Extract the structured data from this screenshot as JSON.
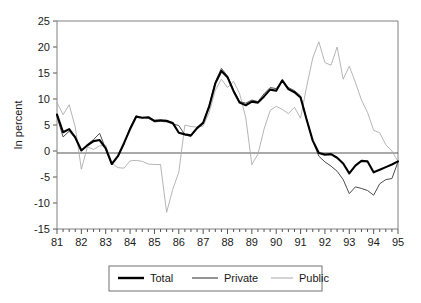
{
  "chart_data": {
    "type": "line",
    "title": "",
    "xlabel": "",
    "ylabel": "In percent",
    "ylim": [
      -15,
      25
    ],
    "xlim": [
      1981.0,
      1995.0
    ],
    "ytick_labels": [
      "25",
      "20",
      "15",
      "10",
      "5",
      "0",
      "-5",
      "-10",
      "-15"
    ],
    "ytick_values": [
      25,
      20,
      15,
      10,
      5,
      0,
      -5,
      -10,
      -15
    ],
    "xtick_labels": [
      "81",
      "82",
      "83",
      "84",
      "85",
      "86",
      "87",
      "88",
      "89",
      "90",
      "91",
      "92",
      "93",
      "94",
      "95"
    ],
    "xtick_values": [
      1981,
      1982,
      1983,
      1984,
      1985,
      1986,
      1987,
      1988,
      1989,
      1990,
      1991,
      1992,
      1993,
      1994,
      1995
    ],
    "minor_ticks_per_interval": 4,
    "grid": false,
    "zero_line": true,
    "legend_position": "bottom-center",
    "legend": [
      "Total",
      "Private",
      "Public"
    ],
    "colors": {
      "total": "#000000",
      "private": "#4d4d4d",
      "public": "#a8a8a8",
      "axis": "#808080",
      "background": "#ffffff"
    },
    "x": [
      1981.0,
      1981.25,
      1981.5,
      1981.75,
      1982.0,
      1982.25,
      1982.5,
      1982.75,
      1983.0,
      1983.25,
      1983.5,
      1983.75,
      1984.0,
      1984.25,
      1984.5,
      1984.75,
      1985.0,
      1985.25,
      1985.5,
      1985.75,
      1986.0,
      1986.25,
      1986.5,
      1986.75,
      1987.0,
      1987.25,
      1987.5,
      1987.75,
      1988.0,
      1988.25,
      1988.5,
      1988.75,
      1989.0,
      1989.25,
      1989.5,
      1989.75,
      1990.0,
      1990.25,
      1990.5,
      1990.75,
      1991.0,
      1991.25,
      1991.5,
      1991.75,
      1992.0,
      1992.25,
      1992.5,
      1992.75,
      1993.0,
      1993.25,
      1993.5,
      1993.75,
      1994.0,
      1994.25,
      1994.5,
      1994.75,
      1995.0
    ],
    "series": [
      {
        "name": "Total",
        "values": [
          7.0,
          3.6,
          4.2,
          2.6,
          0.1,
          1.1,
          1.9,
          2.1,
          0.5,
          -2.5,
          -1.0,
          1.5,
          4.2,
          6.6,
          6.4,
          6.5,
          5.8,
          5.9,
          5.8,
          5.4,
          3.5,
          3.2,
          3.0,
          4.4,
          5.4,
          8.6,
          13.0,
          15.4,
          14.2,
          11.5,
          9.3,
          8.8,
          9.5,
          9.3,
          10.5,
          11.8,
          11.6,
          13.6,
          11.9,
          11.3,
          10.3,
          6.0,
          2.0,
          -0.4,
          -0.7,
          -0.6,
          -1.3,
          -2.4,
          -4.3,
          -2.8,
          -1.9,
          -2.0,
          -4.1,
          -3.6,
          -3.1,
          -2.6,
          -2.0
        ]
      },
      {
        "name": "Private",
        "values": [
          6.6,
          2.7,
          3.8,
          2.5,
          0.0,
          1.3,
          2.2,
          3.4,
          0.4,
          -2.6,
          -1.1,
          1.3,
          4.5,
          6.8,
          6.4,
          6.3,
          5.6,
          5.7,
          5.6,
          5.2,
          4.9,
          3.1,
          2.8,
          4.3,
          5.5,
          8.8,
          13.3,
          15.9,
          14.4,
          11.7,
          9.5,
          9.2,
          9.8,
          9.5,
          11.0,
          12.2,
          12.0,
          13.5,
          12.2,
          11.6,
          10.6,
          6.1,
          1.9,
          -1.0,
          -2.1,
          -2.9,
          -3.9,
          -5.5,
          -8.2,
          -6.9,
          -7.2,
          -7.6,
          -8.5,
          -6.3,
          -5.5,
          -5.3,
          -2.1
        ]
      },
      {
        "name": "Public",
        "values": [
          9.3,
          7.0,
          8.9,
          4.6,
          -3.5,
          0.8,
          0.3,
          1.0,
          1.1,
          -2.3,
          -3.2,
          -3.3,
          -1.9,
          -1.8,
          -2.0,
          -2.5,
          -2.6,
          -2.6,
          -11.8,
          -7.4,
          -4.1,
          5.0,
          4.7,
          4.6,
          4.8,
          7.4,
          11.7,
          13.8,
          12.2,
          13.4,
          11.0,
          6.4,
          -2.6,
          -0.6,
          4.2,
          7.8,
          8.6,
          8.0,
          7.2,
          8.4,
          6.3,
          12.4,
          17.9,
          21.0,
          17.0,
          16.5,
          20.0,
          13.8,
          16.3,
          13.2,
          9.8,
          7.4,
          4.0,
          3.5,
          1.2,
          0.0,
          -2.0
        ]
      }
    ]
  },
  "axis": {
    "ylabel": "In percent"
  },
  "legend": {
    "items": [
      {
        "label": "Total",
        "key": "total"
      },
      {
        "label": "Private",
        "key": "private"
      },
      {
        "label": "Public",
        "key": "public"
      }
    ]
  }
}
